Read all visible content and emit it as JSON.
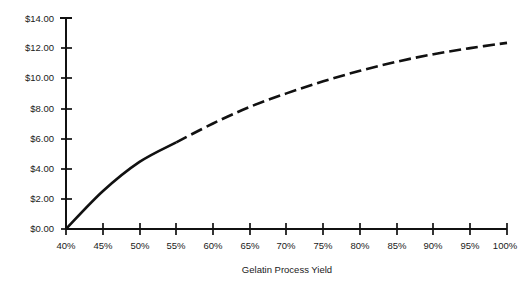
{
  "chart_data": {
    "type": "line",
    "title": "",
    "xlabel": "Gelatin Process Yield",
    "ylabel": "",
    "x": [
      40,
      45,
      50,
      55,
      60,
      65,
      70,
      75,
      80,
      85,
      90,
      95,
      100
    ],
    "values": [
      0.0,
      2.5,
      4.45,
      5.75,
      7.0,
      8.1,
      9.0,
      9.8,
      10.5,
      11.1,
      11.6,
      12.0,
      12.35
    ],
    "series": [
      {
        "name": "Value",
        "values": [
          0.0,
          2.5,
          4.45,
          5.75,
          7.0,
          8.1,
          9.0,
          9.8,
          10.5,
          11.1,
          11.6,
          12.0,
          12.35
        ]
      }
    ],
    "x_tick_labels": [
      "40%",
      "45%",
      "50%",
      "55%",
      "60%",
      "65%",
      "70%",
      "75%",
      "80%",
      "85%",
      "90%",
      "95%",
      "100%"
    ],
    "y_tick_labels": [
      "$0.00",
      "$2.00",
      "$4.00",
      "$6.00",
      "$8.00",
      "$10.00",
      "$12.00",
      "$14.00"
    ],
    "y_tick_values": [
      0,
      2,
      4,
      6,
      8,
      10,
      12,
      14
    ],
    "xlim": [
      40,
      100
    ],
    "ylim": [
      0,
      14
    ],
    "grid": false,
    "legend": "none",
    "line_style": "solid-to-dashed",
    "line_color": "#111111",
    "dash_start_x": 55
  },
  "axis": {
    "x_title": "Gelatin Process Yield"
  },
  "labels": {
    "y": {
      "t0": "$0.00",
      "t1": "$2.00",
      "t2": "$4.00",
      "t3": "$6.00",
      "t4": "$8.00",
      "t5": "$10.00",
      "t6": "$12.00",
      "t7": "$14.00"
    },
    "x": {
      "t0": "40%",
      "t1": "45%",
      "t2": "50%",
      "t3": "55%",
      "t4": "60%",
      "t5": "65%",
      "t6": "70%",
      "t7": "75%",
      "t8": "80%",
      "t9": "85%",
      "t10": "90%",
      "t11": "95%",
      "t12": "100%"
    }
  }
}
